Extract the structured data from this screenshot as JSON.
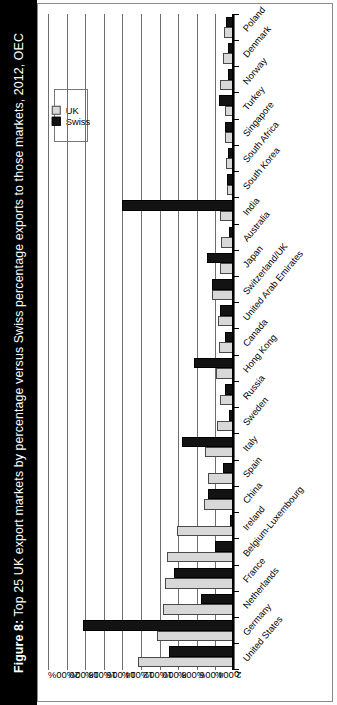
{
  "figure": {
    "label": "Figure 8:",
    "caption": "Top 25 UK export markets by percentage versus Swiss percentage exports to those markets, 2012, OEC"
  },
  "legend": {
    "position": "top-left-inside",
    "items": [
      {
        "name": "UK",
        "color": "#d8d8d8"
      },
      {
        "name": "Swiss",
        "color": "#131313"
      }
    ]
  },
  "chart_data": {
    "type": "bar",
    "orientation": "vertical-rotated",
    "title": "Top 25 UK export markets by percentage versus Swiss percentage exports to those markets, 2012, OEC",
    "xlabel": "",
    "ylabel": "",
    "ylim": [
      0,
      20
    ],
    "grid": true,
    "ytick_labels": [
      "20.00%",
      "18.00%",
      "16.00%",
      "14.00%",
      "12.00%",
      "10.00%",
      "8.00%",
      "6.00%",
      "4.00%",
      "2.00%",
      "0"
    ],
    "ytick_values": [
      20,
      18,
      16,
      14,
      12,
      10,
      8,
      6,
      4,
      2,
      0
    ],
    "categories": [
      "United States",
      "Germany",
      "Netherlands",
      "France",
      "Belgium-Luxembourg",
      "Ireland",
      "China",
      "Spain",
      "Italy",
      "Sweden",
      "Russia",
      "Hong Kong",
      "Canada",
      "United Arab Emirates",
      "Switzerland/UK",
      "Japan",
      "Australia",
      "India",
      "South Korea",
      "South Africa",
      "Singapore",
      "Turkey",
      "Norway",
      "Denmark",
      "Poland"
    ],
    "series": [
      {
        "name": "UK",
        "color": "#d8d8d8",
        "values": [
          10.3,
          8.3,
          7.6,
          7.4,
          7.2,
          6.1,
          3.2,
          2.8,
          3.1,
          1.8,
          1.5,
          1.9,
          1.6,
          1.7,
          2.4,
          1.5,
          1.4,
          1.5,
          0.8,
          0.9,
          1.0,
          1.0,
          1.5,
          1.2,
          1.1
        ]
      },
      {
        "name": "Swiss",
        "color": "#131313",
        "values": [
          7.0,
          16.2,
          3.5,
          6.5,
          2.0,
          0.4,
          2.8,
          1.2,
          5.6,
          0.5,
          1.0,
          4.3,
          1.0,
          1.5,
          2.4,
          2.9,
          0.5,
          12.0,
          0.8,
          0.6,
          1.0,
          1.6,
          0.7,
          0.7,
          0.9
        ]
      }
    ]
  }
}
